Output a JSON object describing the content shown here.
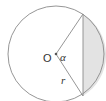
{
  "diagram": {
    "type": "circle-segment",
    "center_label": "O",
    "angle_label": "α",
    "radius_label": "r",
    "colors": {
      "stroke": "#8a8a8a",
      "fill_segment": "#e3e3e3",
      "background": "#ffffff",
      "text": "#333333"
    },
    "geometry": {
      "center": [
        56,
        54
      ],
      "radius": 48,
      "chord_top": [
        83,
        14
      ],
      "chord_bottom": [
        83,
        96
      ]
    }
  }
}
